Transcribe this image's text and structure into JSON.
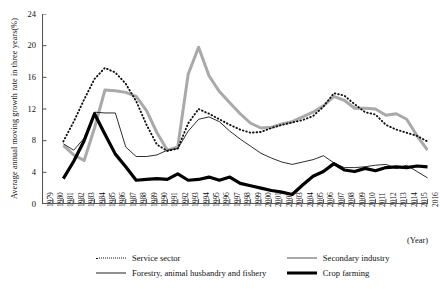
{
  "chart_data": {
    "type": "line",
    "title": "",
    "xlabel": "(Year)",
    "ylabel": "Average annual moving growth rate in three years(%)",
    "ylim": [
      0,
      24
    ],
    "yticks": [
      0,
      4,
      8,
      12,
      16,
      20,
      24
    ],
    "grid": false,
    "legend_position": "bottom",
    "x": [
      1979,
      1980,
      1981,
      1982,
      1983,
      1984,
      1985,
      1986,
      1987,
      1988,
      1989,
      1990,
      1991,
      1992,
      1993,
      1994,
      1995,
      1996,
      1997,
      1998,
      1999,
      2000,
      2001,
      2002,
      2003,
      2004,
      2005,
      2006,
      2007,
      2008,
      2009,
      2010,
      2011,
      2012,
      2013,
      2014,
      2015,
      2016
    ],
    "categories": [
      "1979",
      "1980",
      "1981",
      "1982",
      "1983",
      "1984",
      "1985",
      "1986",
      "1987",
      "1988",
      "1989",
      "1990",
      "1991",
      "1992",
      "1993",
      "1994",
      "1995",
      "1996",
      "1997",
      "1998",
      "1999",
      "2000",
      "2001",
      "2002",
      "2003",
      "2004",
      "2005",
      "2006",
      "2007",
      "2008",
      "2009",
      "2010",
      "2011",
      "2012",
      "2013",
      "2014",
      "2015",
      "2016"
    ],
    "series": [
      {
        "name": "Service sector",
        "style": "dotted",
        "color": "#111111",
        "values": [
          null,
          null,
          7.9,
          10.4,
          13.2,
          15.8,
          17.2,
          16.6,
          15.2,
          13.0,
          10.0,
          7.5,
          6.7,
          7.0,
          10.2,
          12.0,
          11.4,
          10.7,
          10.0,
          9.4,
          9.0,
          9.1,
          9.6,
          10.0,
          10.3,
          10.6,
          11.1,
          12.3,
          14.0,
          13.7,
          12.6,
          11.6,
          11.3,
          10.0,
          9.4,
          9.0,
          8.6,
          7.9
        ]
      },
      {
        "name": "Secondary industry",
        "style": "thick-gray",
        "color": "#a9a9a9",
        "values": [
          null,
          null,
          7.4,
          6.2,
          5.5,
          9.6,
          14.4,
          14.3,
          14.1,
          13.6,
          11.8,
          9.0,
          6.8,
          7.2,
          16.4,
          19.8,
          16.2,
          14.2,
          12.8,
          11.4,
          10.2,
          9.6,
          9.7,
          10.1,
          10.4,
          11.0,
          11.6,
          12.4,
          13.6,
          13.1,
          12.1,
          12.1,
          12.0,
          11.2,
          11.4,
          10.7,
          8.6,
          6.8
        ]
      },
      {
        "name": "Forestry, animal husbandry and fishery",
        "style": "thin",
        "color": "#222222",
        "values": [
          null,
          null,
          7.6,
          6.8,
          8.3,
          11.6,
          11.5,
          11.5,
          7.2,
          6.0,
          6.0,
          6.2,
          6.8,
          7.0,
          9.2,
          10.7,
          11.0,
          10.4,
          9.2,
          8.2,
          7.3,
          6.4,
          5.8,
          5.3,
          5.0,
          5.3,
          5.6,
          6.1,
          5.2,
          4.6,
          4.6,
          4.7,
          4.9,
          5.0,
          4.5,
          4.9,
          4.1,
          3.3
        ]
      },
      {
        "name": "Crop farming",
        "style": "thick-black",
        "color": "#000000",
        "values": [
          null,
          null,
          3.2,
          5.4,
          8.0,
          11.4,
          8.8,
          6.3,
          4.7,
          3.0,
          3.1,
          3.2,
          3.1,
          3.8,
          3.0,
          3.1,
          3.4,
          3.0,
          3.4,
          2.6,
          2.3,
          2.0,
          1.7,
          1.5,
          1.2,
          2.4,
          3.5,
          4.1,
          5.1,
          4.3,
          4.1,
          4.5,
          4.2,
          4.6,
          4.7,
          4.6,
          4.8,
          4.7
        ]
      }
    ]
  },
  "axis": {
    "y_title": "Average annual moving growth rate in three years(%)",
    "x_caption": "(Year)"
  },
  "legend": {
    "items": [
      {
        "label": "Service sector",
        "style": "dotted"
      },
      {
        "label": "Secondary industry",
        "style": "thick-gray"
      },
      {
        "label": "Forestry, animal husbandry and fishery",
        "style": "thin"
      },
      {
        "label": "Crop farming",
        "style": "thick-black"
      }
    ]
  },
  "colors": {
    "axis": "#555555",
    "gray_series": "#a9a9a9",
    "black_series": "#000000",
    "background": "#ffffff"
  }
}
